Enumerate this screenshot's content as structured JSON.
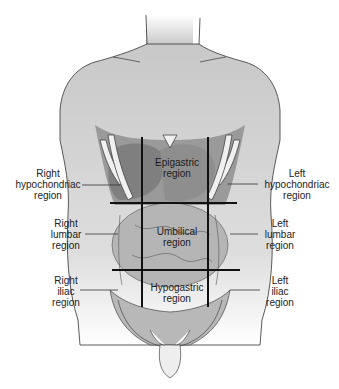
{
  "diagram": {
    "colors": {
      "skin": "#c8c8c8",
      "organ_dark": "#8c8c8c",
      "organ_mid": "#a8a8a8",
      "bone": "#f2f2f2",
      "grid_line": "#111111",
      "text": "#222222"
    },
    "regions_inner": [
      {
        "id": "epigastric",
        "line1": "Epigastric",
        "line2": "region"
      },
      {
        "id": "umbilical",
        "line1": "Umbilical",
        "line2": "region"
      },
      {
        "id": "hypogastric",
        "line1": "Hypogastric",
        "line2": "region"
      }
    ],
    "labels_right": [
      {
        "id": "right-hypochondriac",
        "line1": "Right",
        "line2": "hypochondriac",
        "line3": "region"
      },
      {
        "id": "right-lumbar",
        "line1": "Right",
        "line2": "lumbar",
        "line3": "region"
      },
      {
        "id": "right-iliac",
        "line1": "Right",
        "line2": "iliac",
        "line3": "region"
      }
    ],
    "labels_left": [
      {
        "id": "left-hypochondriac",
        "line1": "Left",
        "line2": "hypochondriac",
        "line3": "region"
      },
      {
        "id": "left-lumbar",
        "line1": "Left",
        "line2": "lumbar",
        "line3": "region"
      },
      {
        "id": "left-iliac",
        "line1": "Left",
        "line2": "iliac",
        "line3": "region"
      }
    ]
  }
}
